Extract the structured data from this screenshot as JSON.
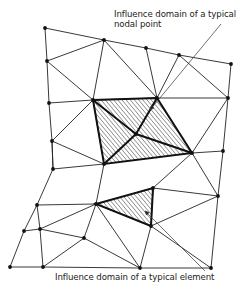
{
  "labels": {
    "nodal_line1": "Influence domain of a typical",
    "nodal_line2": "nodal point",
    "element": "Influence domain of a typical element"
  },
  "colors": {
    "line": "#222222",
    "hatch": "#333333",
    "background": "#ffffff"
  },
  "mesh": {
    "nodes": [
      [
        45,
        28
      ],
      [
        104,
        40
      ],
      [
        146,
        48
      ],
      [
        179,
        55
      ],
      [
        231,
        64
      ],
      [
        47,
        61
      ],
      [
        93,
        100
      ],
      [
        157,
        98
      ],
      [
        228,
        98
      ],
      [
        49,
        103
      ],
      [
        52,
        141
      ],
      [
        104,
        164
      ],
      [
        136,
        134
      ],
      [
        192,
        153
      ],
      [
        223,
        151
      ],
      [
        53,
        169
      ],
      [
        37,
        205
      ],
      [
        96,
        204
      ],
      [
        153,
        188
      ],
      [
        218,
        196
      ],
      [
        24,
        231
      ],
      [
        40,
        229
      ],
      [
        84,
        238
      ],
      [
        151,
        226
      ],
      [
        10,
        267
      ],
      [
        43,
        267
      ],
      [
        140,
        268
      ],
      [
        211,
        268
      ]
    ],
    "edges": [
      [
        0,
        1
      ],
      [
        1,
        2
      ],
      [
        2,
        3
      ],
      [
        3,
        4
      ],
      [
        0,
        5
      ],
      [
        5,
        1
      ],
      [
        5,
        6
      ],
      [
        1,
        6
      ],
      [
        1,
        7
      ],
      [
        2,
        7
      ],
      [
        3,
        7
      ],
      [
        3,
        8
      ],
      [
        4,
        8
      ],
      [
        5,
        9
      ],
      [
        9,
        6
      ],
      [
        6,
        7
      ],
      [
        7,
        8
      ],
      [
        9,
        10
      ],
      [
        10,
        6
      ],
      [
        6,
        11
      ],
      [
        11,
        12
      ],
      [
        12,
        7
      ],
      [
        7,
        13
      ],
      [
        8,
        13
      ],
      [
        8,
        14
      ],
      [
        13,
        14
      ],
      [
        12,
        13
      ],
      [
        6,
        12
      ],
      [
        10,
        11
      ],
      [
        10,
        15
      ],
      [
        15,
        11
      ],
      [
        11,
        17
      ],
      [
        15,
        16
      ],
      [
        16,
        17
      ],
      [
        17,
        18
      ],
      [
        18,
        13
      ],
      [
        13,
        19
      ],
      [
        14,
        19
      ],
      [
        18,
        19
      ],
      [
        16,
        20
      ],
      [
        16,
        21
      ],
      [
        21,
        17
      ],
      [
        20,
        21
      ],
      [
        21,
        22
      ],
      [
        22,
        17
      ],
      [
        17,
        23
      ],
      [
        18,
        23
      ],
      [
        23,
        19
      ],
      [
        19,
        27
      ],
      [
        20,
        24
      ],
      [
        21,
        25
      ],
      [
        24,
        25
      ],
      [
        25,
        22
      ],
      [
        22,
        26
      ],
      [
        17,
        26
      ],
      [
        23,
        26
      ],
      [
        25,
        26
      ],
      [
        26,
        27
      ],
      [
        23,
        27
      ],
      [
        15,
        10
      ]
    ]
  },
  "hatched": {
    "nodal_patch": [
      [
        93,
        100
      ],
      [
        157,
        98
      ],
      [
        192,
        153
      ],
      [
        104,
        164
      ]
    ],
    "element_patch": [
      [
        96,
        204
      ],
      [
        153,
        188
      ],
      [
        151,
        226
      ]
    ]
  },
  "leaders": {
    "nodal": {
      "from": [
        221,
        24
      ],
      "to": [
        150,
        110
      ]
    },
    "element": {
      "from": [
        205,
        271
      ],
      "to": [
        145,
        211
      ]
    }
  }
}
